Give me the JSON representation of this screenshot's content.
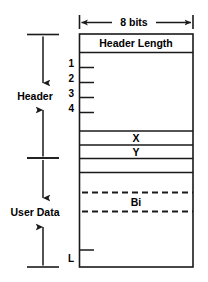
{
  "figure": {
    "kind": "pdu-structure-diagram",
    "colors": {
      "line": "#1a1a1a",
      "text": "#000000",
      "background": "#ffffff"
    }
  },
  "width_dimension": {
    "label": "8 bits",
    "icon_left": "arrow-left-icon",
    "icon_right": "arrow-right-icon"
  },
  "side_brackets": [
    {
      "label": "Header"
    },
    {
      "label": "User Data"
    }
  ],
  "octet_ticks": [
    {
      "label": "1"
    },
    {
      "label": "2"
    },
    {
      "label": "3"
    },
    {
      "label": "4"
    }
  ],
  "bottom_tick": {
    "label": "L"
  },
  "fields": [
    {
      "label": "Header Length"
    },
    {
      "label": ""
    },
    {
      "label": "X"
    },
    {
      "label": "Y"
    },
    {
      "label": ""
    },
    {
      "label": ""
    },
    {
      "label": "Bi"
    },
    {
      "label": ""
    }
  ]
}
